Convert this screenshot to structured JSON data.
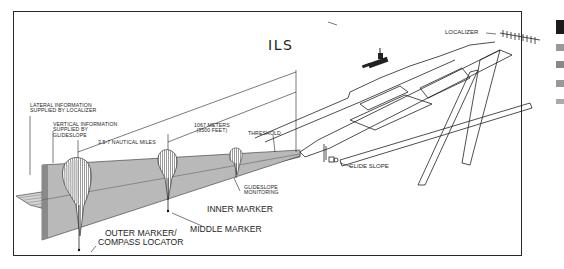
{
  "diagram": {
    "title": "ILS",
    "labels": {
      "localizer": "LOCALIZER",
      "lateral_info_line1": "LATERAL INFORMATION",
      "lateral_info_line2": "SUPPLIED BY LOCALIZER",
      "vertical_info_line1": "VERTICAL INFORMATION",
      "vertical_info_line2": "SUPPLIED BY",
      "vertical_info_line3": "GLIDESLOPE",
      "distance_nm": "3.5-7 NAUTICAL MILES",
      "distance_m_line1": "1067 METERS",
      "distance_m_line2": "(3500 FEET)",
      "threshold": "THRESHOLD",
      "glideslope_monitoring_line1": "GLIDESLOPE",
      "glideslope_monitoring_line2": "MONITORING",
      "glide_slope": "GLIDE SLOPE",
      "inner_marker": "INNER MARKER",
      "middle_marker": "MIDDLE MARKER",
      "outer_marker_line1": "OUTER MARKER/",
      "outer_marker_line2": "COMPASS LOCATOR"
    },
    "colors": {
      "line": "#1e1e1e",
      "plane_fill": "#b8b8b8",
      "plane_dark": "#7a7a7a",
      "background": "#ffffff"
    }
  }
}
